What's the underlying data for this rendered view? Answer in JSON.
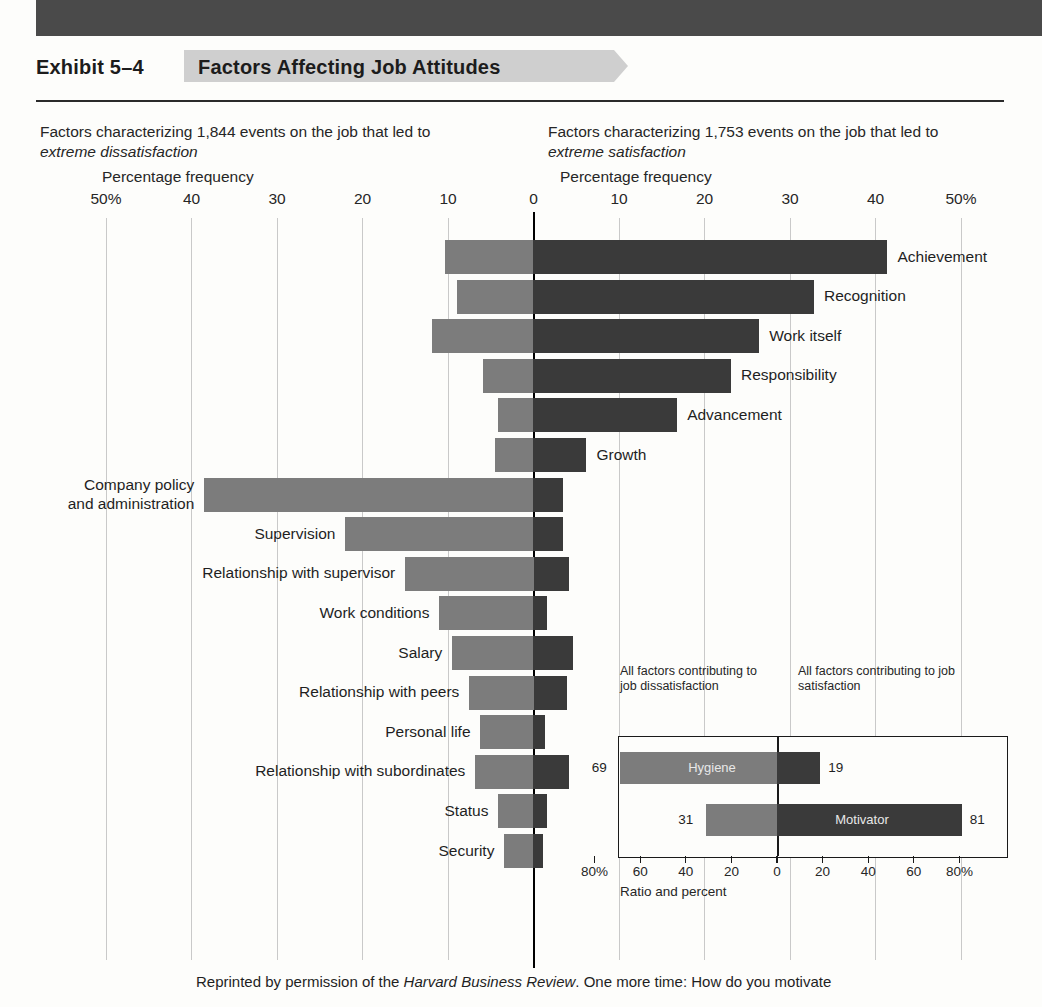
{
  "exhibit": {
    "number": "Exhibit 5–4",
    "title": "Factors Affecting Job Attitudes"
  },
  "header": {
    "left_blurb_line1": "Factors characterizing 1,844 events on the job that led to",
    "left_blurb_line2": "extreme dissatisfaction",
    "right_blurb_line1": "Factors characterizing 1,753 events on the job that led to",
    "right_blurb_line2": "extreme satisfaction",
    "left_axis_caption": "Percentage frequency",
    "right_axis_caption": "Percentage frequency"
  },
  "footer": {
    "text_before": "Reprinted by permission of the ",
    "italic": "Harvard Business Review",
    "text_after": ". One more time: How do you motivate"
  },
  "colors": {
    "dissatisfaction_bar": "#7c7c7c",
    "satisfaction_bar": "#3a3a3a",
    "axis": "#000000",
    "gridline": "#c9c9c9",
    "title_tab": "#cfcfcf",
    "top_band": "#4a4a4a"
  },
  "chart_data": {
    "type": "bar",
    "title": "Factors Affecting Job Attitudes",
    "orientation": "horizontal-diverging",
    "xlabel": "Percentage frequency",
    "ylabel": "",
    "xlim": [
      -50,
      50
    ],
    "grid": true,
    "legend": "none",
    "tick_labels": [
      "50%",
      "40",
      "30",
      "20",
      "10",
      "0",
      "10",
      "20",
      "30",
      "40",
      "50%"
    ],
    "tick_values": [
      -50,
      -40,
      -30,
      -20,
      -10,
      0,
      10,
      20,
      30,
      40,
      50
    ],
    "series": [
      {
        "name": "extreme dissatisfaction",
        "color": "#7c7c7c",
        "side": "left"
      },
      {
        "name": "extreme satisfaction",
        "color": "#3a3a3a",
        "side": "right"
      }
    ],
    "categories": [
      "Achievement",
      "Recognition",
      "Work itself",
      "Responsibility",
      "Advancement",
      "Growth",
      "Company policy and administration",
      "Supervision",
      "Relationship with supervisor",
      "Work conditions",
      "Salary",
      "Relationship with peers",
      "Personal life",
      "Relationship with subordinates",
      "Status",
      "Security"
    ],
    "points": [
      {
        "label": "Achievement",
        "label_lines": [
          "Achievement"
        ],
        "label_side": "right",
        "dissatisfaction": 10.4,
        "satisfaction": 41.4
      },
      {
        "label": "Recognition",
        "label_lines": [
          "Recognition"
        ],
        "label_side": "right",
        "dissatisfaction": 8.9,
        "satisfaction": 32.8
      },
      {
        "label": "Work itself",
        "label_lines": [
          "Work itself"
        ],
        "label_side": "right",
        "dissatisfaction": 11.9,
        "satisfaction": 26.4
      },
      {
        "label": "Responsibility",
        "label_lines": [
          "Responsibility"
        ],
        "label_side": "right",
        "dissatisfaction": 5.9,
        "satisfaction": 23.1
      },
      {
        "label": "Advancement",
        "label_lines": [
          "Advancement"
        ],
        "label_side": "right",
        "dissatisfaction": 4.2,
        "satisfaction": 16.8
      },
      {
        "label": "Growth",
        "label_lines": [
          "Growth"
        ],
        "label_side": "right",
        "dissatisfaction": 4.5,
        "satisfaction": 6.2
      },
      {
        "label": "Company policy and administration",
        "label_lines": [
          "Company policy",
          "and administration"
        ],
        "label_side": "left",
        "dissatisfaction": 38.5,
        "satisfaction": 3.4
      },
      {
        "label": "Supervision",
        "label_lines": [
          "Supervision"
        ],
        "label_side": "left",
        "dissatisfaction": 22.0,
        "satisfaction": 3.4
      },
      {
        "label": "Relationship with supervisor",
        "label_lines": [
          "Relationship with supervisor"
        ],
        "label_side": "left",
        "dissatisfaction": 15.0,
        "satisfaction": 4.1
      },
      {
        "label": "Work conditions",
        "label_lines": [
          "Work conditions"
        ],
        "label_side": "left",
        "dissatisfaction": 11.0,
        "satisfaction": 1.6
      },
      {
        "label": "Salary",
        "label_lines": [
          "Salary"
        ],
        "label_side": "left",
        "dissatisfaction": 9.5,
        "satisfaction": 4.6
      },
      {
        "label": "Relationship with peers",
        "label_lines": [
          "Relationship with peers"
        ],
        "label_side": "left",
        "dissatisfaction": 7.5,
        "satisfaction": 3.9
      },
      {
        "label": "Personal life",
        "label_lines": [
          "Personal life"
        ],
        "label_side": "left",
        "dissatisfaction": 6.2,
        "satisfaction": 1.4
      },
      {
        "label": "Relationship with subordinates",
        "label_lines": [
          "Relationship with subordinates"
        ],
        "label_side": "left",
        "dissatisfaction": 6.8,
        "satisfaction": 4.2
      },
      {
        "label": "Status",
        "label_lines": [
          "Status"
        ],
        "label_side": "left",
        "dissatisfaction": 4.1,
        "satisfaction": 1.6
      },
      {
        "label": "Security",
        "label_lines": [
          "Security"
        ],
        "label_side": "left",
        "dissatisfaction": 3.4,
        "satisfaction": 1.1
      }
    ]
  },
  "inset": {
    "note_left": "All factors contributing to job dissatisfaction",
    "note_right": "All factors contributing to job satisfaction",
    "axis_title": "Ratio and percent",
    "tick_labels": [
      "80%",
      "60",
      "40",
      "20",
      "0",
      "20",
      "40",
      "60",
      "80%"
    ],
    "tick_values": [
      -80,
      -60,
      -40,
      -20,
      0,
      20,
      40,
      60,
      80
    ],
    "bars": [
      {
        "name": "Hygiene",
        "left_value": 69,
        "right_value": 19,
        "left_label": "69",
        "right_label": "19"
      },
      {
        "name": "Motivator",
        "left_value": 31,
        "right_value": 81,
        "left_label": "31",
        "right_label": "81"
      }
    ]
  }
}
